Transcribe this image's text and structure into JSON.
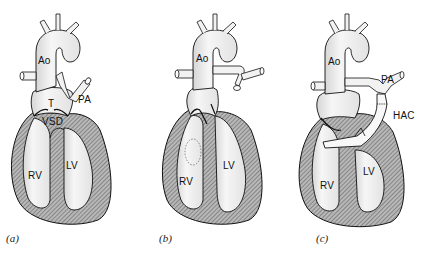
{
  "figure": {
    "panels": [
      {
        "id": "a",
        "caption": "(a)",
        "labels": {
          "ao": "Ao",
          "pa": "PA",
          "t": "T",
          "vsd": "VSD",
          "rv": "RV",
          "lv": "LV"
        }
      },
      {
        "id": "b",
        "caption": "(b)",
        "labels": {
          "ao": "Ao",
          "rv": "RV",
          "lv": "LV"
        }
      },
      {
        "id": "c",
        "caption": "(c)",
        "labels": {
          "ao": "Ao",
          "pa": "PA",
          "hac": "HAC",
          "rv": "RV",
          "lv": "LV"
        }
      }
    ],
    "colors": {
      "outline": "#111111",
      "wall_fill": "#9a9a9a",
      "vessel_fill": "#f4f4f4",
      "background": "#ffffff"
    }
  }
}
